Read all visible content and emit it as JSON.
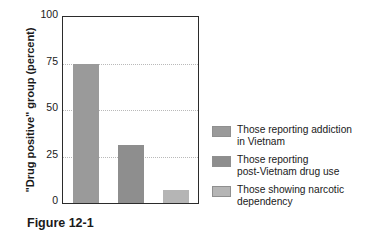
{
  "chart_data": {
    "type": "bar",
    "title": "",
    "xlabel": "",
    "ylabel": "\"Drug positive\" group (percent)",
    "ylim": [
      0,
      100
    ],
    "yticks": [
      0,
      25,
      50,
      75,
      100
    ],
    "ytick_labels": [
      "0",
      "25",
      "50",
      "75",
      "100"
    ],
    "grid": true,
    "grid_axis": "y",
    "legend_position": "right",
    "categories": [
      "Those reporting addiction in Vietnam",
      "Those reporting post-Vietnam drug use",
      "Those showing narcotic dependency"
    ],
    "values": [
      75,
      31,
      7
    ],
    "bar_colors": [
      "#9a9a9a",
      "#8e8e8e",
      "#b5b5b5"
    ],
    "series": [
      {
        "name": "\"Drug positive\" group (percent)",
        "values": [
          75,
          31,
          7
        ]
      }
    ]
  },
  "axis": {
    "y_title": "\"Drug positive\" group (percent)",
    "ticks": [
      {
        "label": "100",
        "value": 100
      },
      {
        "label": "75",
        "value": 75
      },
      {
        "label": "50",
        "value": 50
      },
      {
        "label": "25",
        "value": 25
      },
      {
        "label": "0",
        "value": 0
      }
    ]
  },
  "legend": {
    "items": [
      {
        "label": "Those reporting addiction\nin Vietnam",
        "color": "#9a9a9a"
      },
      {
        "label": "Those reporting\npost-Vietnam drug use",
        "color": "#8e8e8e"
      },
      {
        "label": "Those showing narcotic\ndependency",
        "color": "#b5b5b5"
      }
    ]
  },
  "caption": {
    "text": "Figure 12-1"
  },
  "colors": {
    "axis": "#2b2b2b",
    "grid": "#b9b9b9",
    "text": "#1a1a1a",
    "background": "#ffffff"
  }
}
